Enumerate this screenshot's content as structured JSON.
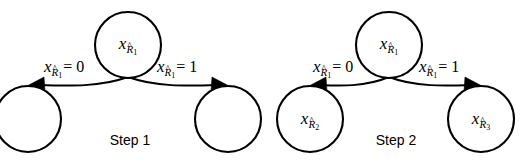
{
  "figure": {
    "background_color": "#ffffff",
    "stroke_color": "#000000",
    "width": 522,
    "height": 164,
    "caption_font_color": "#000000"
  },
  "diagrams": [
    {
      "id": "step-1",
      "step_label": "Step 1",
      "nodes": [
        {
          "id": "root",
          "label_var": "x",
          "label_sub": "R",
          "label_hat": "^",
          "label_subsub": "1",
          "has_label": true,
          "cx": 128,
          "cy": 45,
          "r": 33
        },
        {
          "id": "child-left",
          "label_var": "",
          "label_sub": "",
          "label_hat": "",
          "label_subsub": "",
          "has_label": false,
          "cx": 28,
          "cy": 119,
          "r": 33
        },
        {
          "id": "child-right",
          "label_var": "",
          "label_sub": "",
          "label_hat": "",
          "label_subsub": "",
          "has_label": false,
          "cx": 228,
          "cy": 119,
          "r": 33
        }
      ],
      "edges": [
        {
          "id": "edge-left",
          "label_var": "x",
          "label_sub": "R",
          "label_hat": "^",
          "label_subsub": "1",
          "label_eq": "= 0",
          "direction": "left"
        },
        {
          "id": "edge-right",
          "label_var": "x",
          "label_sub": "R",
          "label_hat": "^",
          "label_subsub": "1",
          "label_eq": "= 1",
          "direction": "right"
        }
      ]
    },
    {
      "id": "step-2",
      "step_label": "Step 2",
      "nodes": [
        {
          "id": "root",
          "label_var": "x",
          "label_sub": "R",
          "label_hat": "^",
          "label_subsub": "1",
          "has_label": true,
          "cx": 389,
          "cy": 45,
          "r": 33
        },
        {
          "id": "child-left",
          "label_var": "x",
          "label_sub": "R",
          "label_hat": "^",
          "label_subsub": "2",
          "has_label": true,
          "cx": 310,
          "cy": 119,
          "r": 33
        },
        {
          "id": "child-right",
          "label_var": "x",
          "label_sub": "R",
          "label_hat": "^",
          "label_subsub": "3",
          "has_label": true,
          "cx": 481,
          "cy": 119,
          "r": 33
        }
      ],
      "edges": [
        {
          "id": "edge-left",
          "label_var": "x",
          "label_sub": "R",
          "label_hat": "^",
          "label_subsub": "1",
          "label_eq": "= 0",
          "direction": "left"
        },
        {
          "id": "edge-right",
          "label_var": "x",
          "label_sub": "R",
          "label_hat": "^",
          "label_subsub": "1",
          "label_eq": "= 1",
          "direction": "right"
        }
      ]
    }
  ]
}
